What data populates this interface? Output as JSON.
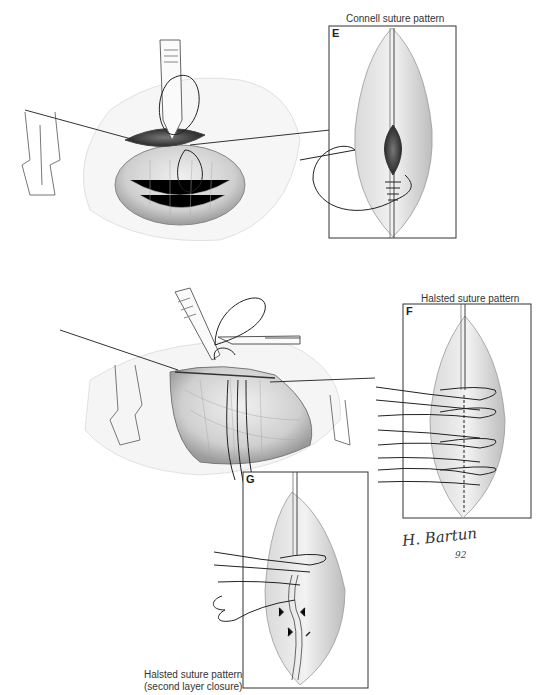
{
  "figure": {
    "panels": [
      {
        "id": "E",
        "letter": "E",
        "caption": "Connell suture pattern"
      },
      {
        "id": "F",
        "letter": "F",
        "caption": "Halsted suture pattern"
      },
      {
        "id": "G",
        "letter": "G",
        "caption_line1": "Halsted suture pattern",
        "caption_line2": "(second layer closure)"
      }
    ],
    "signature": {
      "name": "H. Bartun",
      "year": "92"
    }
  },
  "colors": {
    "ink": "#333333",
    "tissue": "#d8d8d8",
    "background": "#ffffff"
  }
}
